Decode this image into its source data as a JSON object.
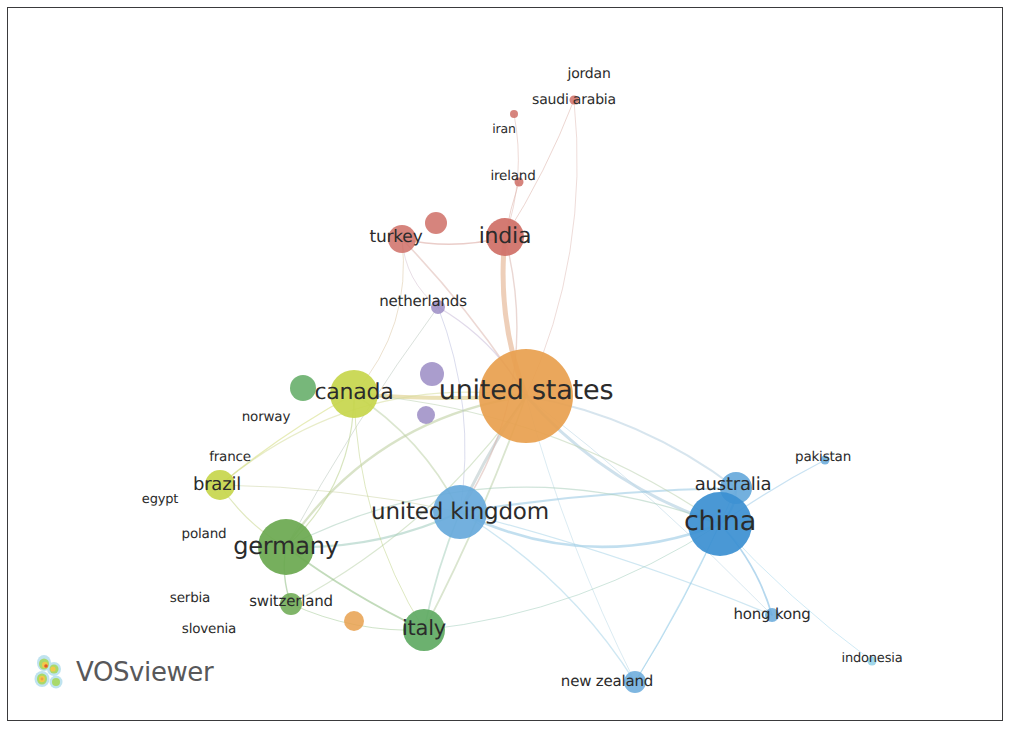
{
  "app": {
    "name": "VOSviewer",
    "logo_label": "VOSviewer",
    "logo_icon": "vosviewer-density-mark"
  },
  "view": {
    "type": "network-visualization",
    "background_color": "#ffffff",
    "frame_color": "#3a3a3c",
    "label_color": "#2b2b2b"
  },
  "clusters": [
    {
      "id": 1,
      "color": "#e8a04e",
      "name": "orange-cluster"
    },
    {
      "id": 2,
      "color": "#cf6f66",
      "name": "red-cluster"
    },
    {
      "id": 3,
      "color": "#67a9db",
      "name": "blue-cluster"
    },
    {
      "id": 4,
      "color": "#6aa84f",
      "name": "green-cluster"
    },
    {
      "id": 5,
      "color": "#c7d64c",
      "name": "yellow-green-cluster"
    },
    {
      "id": 6,
      "color": "#9b8cc4",
      "name": "purple-cluster"
    }
  ],
  "chart_data": {
    "type": "scatter",
    "title": "",
    "xlabel": "",
    "ylabel": "",
    "network_type": "co-authorship countries network",
    "nodes": [
      {
        "label": "jordan",
        "x": 581,
        "y": 66,
        "r": 0,
        "color": "#cf6f66",
        "font": 14,
        "cluster": 2,
        "label_dx": 0,
        "label_dy": 0
      },
      {
        "label": "saudi arabia",
        "x": 566,
        "y": 92,
        "r": 4.5,
        "color": "#cf6f66",
        "font": 14,
        "cluster": 2,
        "label_dx": 0,
        "label_dy": 0
      },
      {
        "label": "iran",
        "x": 506,
        "y": 106,
        "r": 4.0,
        "color": "#cf6f66",
        "font": 12.5,
        "cluster": 2,
        "label_dx": -10,
        "label_dy": 14
      },
      {
        "label": "ireland",
        "x": 511,
        "y": 174,
        "r": 4.5,
        "color": "#cf6f66",
        "font": 13.5,
        "cluster": 2,
        "label_dx": -6,
        "label_dy": -6
      },
      {
        "label": "turkey",
        "x": 394,
        "y": 231,
        "r": 14,
        "color": "#cf6f66",
        "font": 17,
        "cluster": 2,
        "label_dx": -6,
        "label_dy": -2
      },
      {
        "label": "",
        "x": 428,
        "y": 215,
        "r": 11,
        "color": "#cf6f66",
        "font": 0,
        "cluster": 2,
        "label_dx": 0,
        "label_dy": 0
      },
      {
        "label": "india",
        "x": 497,
        "y": 229,
        "r": 19,
        "color": "#cf6f66",
        "font": 22,
        "cluster": 2,
        "label_dx": 0,
        "label_dy": -1
      },
      {
        "label": "netherlands",
        "x": 430,
        "y": 299,
        "r": 7,
        "color": "#9b8cc4",
        "font": 15,
        "cluster": 6,
        "label_dx": -15,
        "label_dy": -6
      },
      {
        "label": "",
        "x": 295,
        "y": 380,
        "r": 13,
        "color": "#5faa63",
        "font": 0,
        "cluster": 4,
        "label_dx": 0,
        "label_dy": 0
      },
      {
        "label": "canada",
        "x": 346,
        "y": 386,
        "r": 24,
        "color": "#c7d64c",
        "font": 22,
        "cluster": 5,
        "label_dx": 0,
        "label_dy": -2
      },
      {
        "label": "",
        "x": 424,
        "y": 366,
        "r": 12,
        "color": "#9b8cc4",
        "font": 0,
        "cluster": 6,
        "label_dx": 0,
        "label_dy": 0
      },
      {
        "label": "",
        "x": 418,
        "y": 407,
        "r": 9,
        "color": "#9b8cc4",
        "font": 0,
        "cluster": 6,
        "label_dx": 0,
        "label_dy": 0
      },
      {
        "label": "united states",
        "x": 518,
        "y": 388,
        "r": 47,
        "color": "#e8a04e",
        "font": 27,
        "cluster": 1,
        "label_dx": 0,
        "label_dy": -6
      },
      {
        "label": "norway",
        "x": 258,
        "y": 409,
        "r": 0,
        "color": "#c7d64c",
        "font": 13.5,
        "cluster": 5,
        "label_dx": 0,
        "label_dy": 0
      },
      {
        "label": "france",
        "x": 222,
        "y": 449,
        "r": 0,
        "color": "#c7d64c",
        "font": 13.5,
        "cluster": 5,
        "label_dx": 0,
        "label_dy": 0
      },
      {
        "label": "brazil",
        "x": 212,
        "y": 477,
        "r": 15,
        "color": "#c7d64c",
        "font": 18,
        "cluster": 5,
        "label_dx": -3,
        "label_dy": -1
      },
      {
        "label": "egypt",
        "x": 152,
        "y": 491,
        "r": 0,
        "color": "#c7d64c",
        "font": 13,
        "cluster": 5,
        "label_dx": 0,
        "label_dy": 0
      },
      {
        "label": "united kingdom",
        "x": 452,
        "y": 504,
        "r": 27,
        "color": "#67a9db",
        "font": 23,
        "cluster": 3,
        "label_dx": 0,
        "label_dy": 0
      },
      {
        "label": "australia",
        "x": 728,
        "y": 480,
        "r": 16,
        "color": "#67a9db",
        "font": 18,
        "cluster": 3,
        "label_dx": -3,
        "label_dy": -4
      },
      {
        "label": "pakistan",
        "x": 817,
        "y": 452,
        "r": 4.5,
        "color": "#67a9db",
        "font": 13.5,
        "cluster": 3,
        "label_dx": -2,
        "label_dy": -3
      },
      {
        "label": "china",
        "x": 712,
        "y": 516,
        "r": 32,
        "color": "#3b8fd1",
        "font": 27,
        "cluster": 3,
        "label_dx": 0,
        "label_dy": -3
      },
      {
        "label": "poland",
        "x": 196,
        "y": 526,
        "r": 0,
        "color": "#6aa84f",
        "font": 13.5,
        "cluster": 4,
        "label_dx": 0,
        "label_dy": 0
      },
      {
        "label": "germany",
        "x": 278,
        "y": 539,
        "r": 28,
        "color": "#6aa84f",
        "font": 24,
        "cluster": 4,
        "label_dx": 0,
        "label_dy": -1
      },
      {
        "label": "serbia",
        "x": 182,
        "y": 590,
        "r": 0,
        "color": "#6aa84f",
        "font": 13.5,
        "cluster": 4,
        "label_dx": 0,
        "label_dy": 0
      },
      {
        "label": "switzerland",
        "x": 283,
        "y": 596,
        "r": 11,
        "color": "#6aa84f",
        "font": 15,
        "cluster": 4,
        "label_dx": 0,
        "label_dy": -3
      },
      {
        "label": "slovenia",
        "x": 201,
        "y": 621,
        "r": 0,
        "color": "#6aa84f",
        "font": 13.5,
        "cluster": 4,
        "label_dx": 0,
        "label_dy": 0
      },
      {
        "label": "",
        "x": 346,
        "y": 613,
        "r": 10,
        "color": "#e8a04e",
        "font": 0,
        "cluster": 1,
        "label_dx": 0,
        "label_dy": 0
      },
      {
        "label": "italy",
        "x": 416,
        "y": 622,
        "r": 21,
        "color": "#5faa63",
        "font": 21,
        "cluster": 4,
        "label_dx": 0,
        "label_dy": -2
      },
      {
        "label": "hong kong",
        "x": 764,
        "y": 607,
        "r": 7,
        "color": "#67a9db",
        "font": 15,
        "cluster": 3,
        "label_dx": 0,
        "label_dy": -1
      },
      {
        "label": "indonesia",
        "x": 864,
        "y": 653,
        "r": 4.5,
        "color": "#8fd0e8",
        "font": 13,
        "cluster": 3,
        "label_dx": 0,
        "label_dy": -3
      },
      {
        "label": "new zealand",
        "x": 627,
        "y": 674,
        "r": 11,
        "color": "#67a9db",
        "font": 15,
        "cluster": 3,
        "label_dx": -28,
        "label_dy": -1
      }
    ],
    "edges": [
      {
        "from": "united states",
        "to": "india",
        "color": "#e0a880",
        "w": 5.0
      },
      {
        "from": "united states",
        "to": "canada",
        "color": "#d8c87a",
        "w": 4.0
      },
      {
        "from": "united states",
        "to": "united kingdom",
        "color": "#b5c4c6",
        "w": 3.0
      },
      {
        "from": "united states",
        "to": "china",
        "color": "#a8c8dc",
        "w": 3.0
      },
      {
        "from": "united states",
        "to": "germany",
        "color": "#b9cc9a",
        "w": 2.4
      },
      {
        "from": "united states",
        "to": "australia",
        "color": "#b6cfe0",
        "w": 2.0
      },
      {
        "from": "united states",
        "to": "italy",
        "color": "#bcd0a8",
        "w": 1.8
      },
      {
        "from": "united states",
        "to": "turkey",
        "color": "#ddb8b0",
        "w": 1.6
      },
      {
        "from": "united states",
        "to": "netherlands",
        "color": "#c9bcd8",
        "w": 1.4
      },
      {
        "from": "united states",
        "to": "brazil",
        "color": "#d6dc9a",
        "w": 1.4
      },
      {
        "from": "united states",
        "to": "switzerland",
        "color": "#bcd4ac",
        "w": 1.2
      },
      {
        "from": "united states",
        "to": "hong kong",
        "color": "#bad6e4",
        "w": 1.0
      },
      {
        "from": "united states",
        "to": "new zealand",
        "color": "#bedae8",
        "w": 1.0
      },
      {
        "from": "united states",
        "to": "saudi arabia",
        "color": "#e0c0ba",
        "w": 1.0
      },
      {
        "from": "united kingdom",
        "to": "china",
        "color": "#8fc4e2",
        "w": 2.6
      },
      {
        "from": "united kingdom",
        "to": "germany",
        "color": "#9fcabb",
        "w": 2.2
      },
      {
        "from": "united kingdom",
        "to": "australia",
        "color": "#96c6e2",
        "w": 2.2
      },
      {
        "from": "united kingdom",
        "to": "italy",
        "color": "#a8cfbe",
        "w": 1.8
      },
      {
        "from": "united kingdom",
        "to": "canada",
        "color": "#bdd2a8",
        "w": 1.6
      },
      {
        "from": "united kingdom",
        "to": "india",
        "color": "#d8b6ae",
        "w": 1.4
      },
      {
        "from": "united kingdom",
        "to": "new zealand",
        "color": "#a8d4e8",
        "w": 1.4
      },
      {
        "from": "united kingdom",
        "to": "hong kong",
        "color": "#a8d4e8",
        "w": 1.2
      },
      {
        "from": "united kingdom",
        "to": "brazil",
        "color": "#cdd6a8",
        "w": 1.0
      },
      {
        "from": "united kingdom",
        "to": "netherlands",
        "color": "#bcc0de",
        "w": 1.0
      },
      {
        "from": "china",
        "to": "australia",
        "color": "#7ab8e0",
        "w": 2.4
      },
      {
        "from": "china",
        "to": "hong kong",
        "color": "#7ab8e0",
        "w": 1.8
      },
      {
        "from": "china",
        "to": "pakistan",
        "color": "#9ccbe8",
        "w": 1.2
      },
      {
        "from": "china",
        "to": "indonesia",
        "color": "#aad8ec",
        "w": 1.0
      },
      {
        "from": "china",
        "to": "canada",
        "color": "#bcd2b0",
        "w": 1.2
      },
      {
        "from": "china",
        "to": "germany",
        "color": "#aacdbc",
        "w": 1.2
      },
      {
        "from": "china",
        "to": "italy",
        "color": "#a6cfc0",
        "w": 1.0
      },
      {
        "from": "china",
        "to": "new zealand",
        "color": "#a0d0e8",
        "w": 1.0
      },
      {
        "from": "germany",
        "to": "italy",
        "color": "#8fbe84",
        "w": 1.8
      },
      {
        "from": "germany",
        "to": "switzerland",
        "color": "#8fbe84",
        "w": 1.4
      },
      {
        "from": "germany",
        "to": "canada",
        "color": "#b8d08a",
        "w": 1.2
      },
      {
        "from": "germany",
        "to": "brazil",
        "color": "#c6d68a",
        "w": 1.2
      },
      {
        "from": "germany",
        "to": "netherlands",
        "color": "#bcc8c0",
        "w": 1.0
      },
      {
        "from": "canada",
        "to": "brazil",
        "color": "#d4dc7e",
        "w": 1.4
      },
      {
        "from": "canada",
        "to": "italy",
        "color": "#c2d68e",
        "w": 1.0
      },
      {
        "from": "canada",
        "to": "turkey",
        "color": "#dcc8a8",
        "w": 1.0
      },
      {
        "from": "india",
        "to": "turkey",
        "color": "#d8a49c",
        "w": 1.4
      },
      {
        "from": "india",
        "to": "ireland",
        "color": "#dcb0a8",
        "w": 1.0
      },
      {
        "from": "india",
        "to": "saudi arabia",
        "color": "#dcb4ac",
        "w": 1.0
      },
      {
        "from": "india",
        "to": "iran",
        "color": "#dcb4ac",
        "w": 0.9
      },
      {
        "from": "turkey",
        "to": "netherlands",
        "color": "#d0bccc",
        "w": 0.9
      },
      {
        "from": "italy",
        "to": "switzerland",
        "color": "#a8cc9a",
        "w": 1.0
      },
      {
        "from": "australia",
        "to": "new zealand",
        "color": "#9cd0ea",
        "w": 1.2
      }
    ]
  }
}
